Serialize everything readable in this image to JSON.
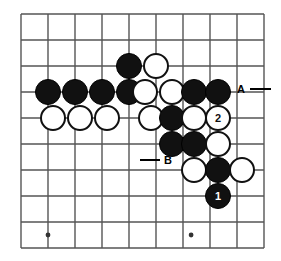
{
  "figure": {
    "kind": "go-board-diagram",
    "width": 281,
    "height": 261,
    "background_color": "#ffffff",
    "line_color": "#555555",
    "black_color": "#111111",
    "white_color": "#ffffff"
  },
  "board": {
    "columns": 10,
    "rows": 10,
    "origin_x": 21,
    "origin_y": 14,
    "spacing_x": 27,
    "spacing_y": 26,
    "stone_radius": 13,
    "star_points": [
      {
        "col": 1,
        "row": 8.5
      },
      {
        "col": 6.3,
        "row": 8.5
      }
    ]
  },
  "stones": [
    {
      "id": "b-c4-r2",
      "color": "black",
      "col": 4,
      "row": 2,
      "label": ""
    },
    {
      "id": "w-c5-r2",
      "color": "white",
      "col": 5,
      "row": 2,
      "label": ""
    },
    {
      "id": "b-c1-r3",
      "color": "black",
      "col": 1,
      "row": 3,
      "label": ""
    },
    {
      "id": "b-c2-r3",
      "color": "black",
      "col": 2,
      "row": 3,
      "label": ""
    },
    {
      "id": "b-c3-r3",
      "color": "black",
      "col": 3,
      "row": 3,
      "label": ""
    },
    {
      "id": "b-c4b-r3",
      "color": "black",
      "col": 4,
      "row": 3,
      "label": ""
    },
    {
      "id": "w-c45-r3",
      "color": "white",
      "col": 4.6,
      "row": 3,
      "label": ""
    },
    {
      "id": "w-c5-r3",
      "color": "white",
      "col": 5.6,
      "row": 3,
      "label": ""
    },
    {
      "id": "b-c65-r3",
      "color": "black",
      "col": 6.4,
      "row": 3,
      "label": ""
    },
    {
      "id": "b-c7-r3",
      "color": "black",
      "col": 7.3,
      "row": 3,
      "label": ""
    },
    {
      "id": "w-c1-r4",
      "color": "white",
      "col": 1.2,
      "row": 4,
      "label": ""
    },
    {
      "id": "w-c2-r4",
      "color": "white",
      "col": 2.2,
      "row": 4,
      "label": ""
    },
    {
      "id": "w-c3-r4",
      "color": "white",
      "col": 3.2,
      "row": 4,
      "label": ""
    },
    {
      "id": "w-c45-r4",
      "color": "white",
      "col": 4.8,
      "row": 4,
      "label": ""
    },
    {
      "id": "b-c56-r4",
      "color": "black",
      "col": 5.6,
      "row": 4,
      "label": ""
    },
    {
      "id": "w-c64-r4",
      "color": "white",
      "col": 6.4,
      "row": 4,
      "label": ""
    },
    {
      "id": "w-c73-r4",
      "color": "white",
      "col": 7.3,
      "row": 4,
      "label": "2"
    },
    {
      "id": "b-c56-r5",
      "color": "black",
      "col": 5.6,
      "row": 5,
      "label": ""
    },
    {
      "id": "b-c64-r5",
      "color": "black",
      "col": 6.4,
      "row": 5,
      "label": ""
    },
    {
      "id": "w-c73-r5",
      "color": "white",
      "col": 7.3,
      "row": 5,
      "label": ""
    },
    {
      "id": "w-c64-r6",
      "color": "white",
      "col": 6.4,
      "row": 6,
      "label": ""
    },
    {
      "id": "b-c73-r6",
      "color": "black",
      "col": 7.3,
      "row": 6,
      "label": ""
    },
    {
      "id": "w-c82-r6",
      "color": "white",
      "col": 8.2,
      "row": 6,
      "label": ""
    },
    {
      "id": "b-c73-r7",
      "color": "black",
      "col": 7.3,
      "row": 7,
      "label": "1"
    }
  ],
  "markers": [
    {
      "id": "marker-a",
      "label": "A",
      "text_x": 237,
      "text_y": 84,
      "dash_x1": 250,
      "dash_x2": 271,
      "dash_y": 88
    },
    {
      "id": "marker-b",
      "label": "B",
      "text_x": 164,
      "text_y": 155,
      "dash_x1": 140,
      "dash_x2": 160,
      "dash_y": 159
    }
  ],
  "accessibility": {
    "description": "Go board diagram showing a black move numbered 1 and a white response numbered 2, with reference points labeled A and B."
  }
}
